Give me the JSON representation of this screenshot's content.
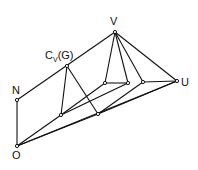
{
  "diagram": {
    "type": "lattice",
    "labels": {
      "V": "V",
      "Cv_main": "C",
      "Cv_sub": "V",
      "Cv_arg": "(G)",
      "N": "N",
      "O": "O",
      "U": "U"
    },
    "nodes": [
      {
        "id": "V",
        "x": 115,
        "y": 32
      },
      {
        "id": "CvG",
        "x": 67,
        "y": 66
      },
      {
        "id": "N",
        "x": 17,
        "y": 100
      },
      {
        "id": "O",
        "x": 17,
        "y": 146
      },
      {
        "id": "A",
        "x": 61,
        "y": 115
      },
      {
        "id": "B",
        "x": 98,
        "y": 114
      },
      {
        "id": "P1",
        "x": 105,
        "y": 83
      },
      {
        "id": "P2",
        "x": 128,
        "y": 83
      },
      {
        "id": "P3",
        "x": 143,
        "y": 82
      },
      {
        "id": "U",
        "x": 177,
        "y": 81
      }
    ],
    "edges": [
      [
        "N",
        "V"
      ],
      [
        "N",
        "O"
      ],
      [
        "CvG",
        "A"
      ],
      [
        "CvG",
        "B"
      ],
      [
        "V",
        "P1"
      ],
      [
        "V",
        "P2"
      ],
      [
        "V",
        "P3"
      ],
      [
        "V",
        "U"
      ],
      [
        "P1",
        "P2"
      ],
      [
        "P3",
        "U"
      ],
      [
        "A",
        "P1"
      ],
      [
        "A",
        "P2"
      ],
      [
        "B",
        "P3"
      ],
      [
        "B",
        "U"
      ],
      [
        "O",
        "A"
      ],
      [
        "O",
        "B"
      ],
      [
        "O",
        "U"
      ]
    ],
    "line_color": "#111111"
  }
}
